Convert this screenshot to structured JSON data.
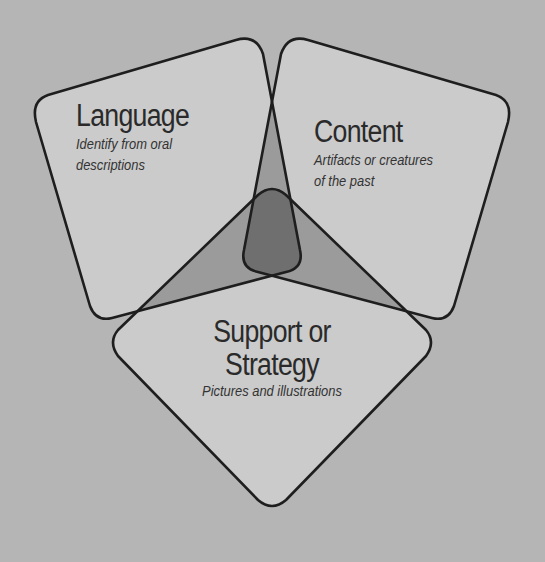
{
  "diagram": {
    "type": "three-set overlapping diagram",
    "colors": {
      "background": "#b5b5b5",
      "shape_fill": "#cbcbcb",
      "double_overlap": "#9b9b9b",
      "triple_overlap": "#6f6f6f",
      "outline": "#1e1e1e",
      "text": "#2a2a2a"
    },
    "sets": [
      {
        "id": "language",
        "title": "Language",
        "subtitle_lines": [
          "Identify from oral",
          "descriptions"
        ]
      },
      {
        "id": "content",
        "title": "Content",
        "subtitle_lines": [
          "Artifacts or creatures",
          "of the past"
        ]
      },
      {
        "id": "support",
        "title_lines": [
          "Support or",
          "Strategy"
        ],
        "subtitle_lines": [
          "Pictures and illustrations"
        ]
      }
    ]
  }
}
